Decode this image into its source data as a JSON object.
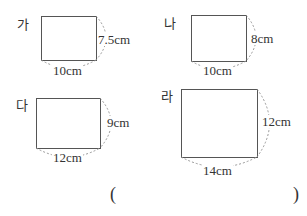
{
  "figures": [
    {
      "label": "가",
      "width": "10cm",
      "height": "7.5cm"
    },
    {
      "label": "나",
      "width": "10cm",
      "height": "8cm"
    },
    {
      "label": "다",
      "width": "12cm",
      "height": "9cm"
    },
    {
      "label": "라",
      "width": "14cm",
      "height": "12cm"
    }
  ],
  "answer": {
    "open": "(",
    "close": ")",
    "value": ""
  }
}
